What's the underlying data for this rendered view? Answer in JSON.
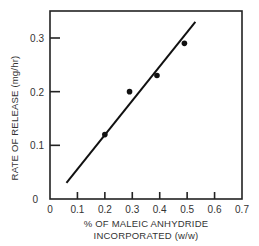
{
  "chart_data": {
    "type": "scatter",
    "title": "",
    "xlabel_line1": "% OF MALEIC ANHYDRIDE",
    "xlabel_line2": "INCORPORATED (w/w)",
    "ylabel": "RATE OF RELEASE (mg/hr)",
    "xlim": [
      0,
      0.7
    ],
    "ylim": [
      0,
      0.35
    ],
    "x_ticks": [
      "0",
      "0.1",
      "0.2",
      "0.3",
      "0.4",
      "0.5",
      "0.6",
      "0.7"
    ],
    "y_ticks": [
      "0",
      "0.1",
      "0.2",
      "0.3"
    ],
    "grid": false,
    "series": [
      {
        "name": "Measured",
        "type": "scatter",
        "x": [
          0.2,
          0.29,
          0.39,
          0.49
        ],
        "y": [
          0.12,
          0.2,
          0.23,
          0.29
        ]
      },
      {
        "name": "Fit line",
        "type": "line",
        "x": [
          0.06,
          0.53
        ],
        "y": [
          0.03,
          0.33
        ]
      }
    ]
  }
}
